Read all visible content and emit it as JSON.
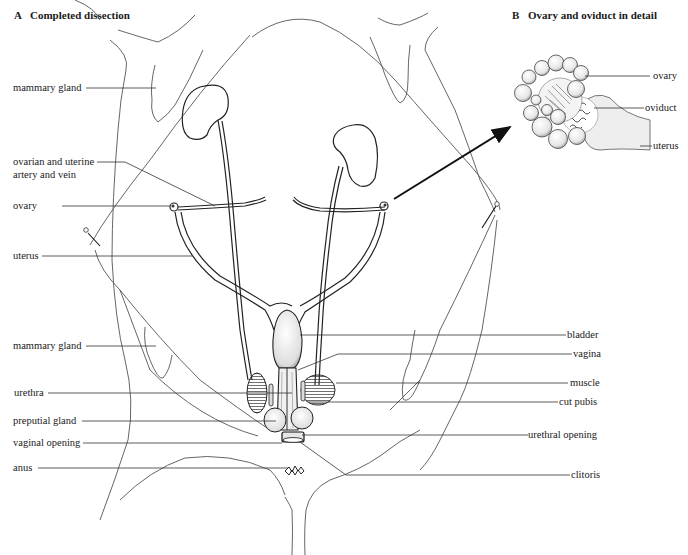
{
  "panel_a": {
    "letter": "A",
    "title": "Completed dissection",
    "labels_left": [
      "mammary gland",
      "ovarian and uterine",
      "artery and vein",
      "ovary",
      "uterus",
      "mammary gland",
      "urethra",
      "preputial gland",
      "vaginal opening",
      "anus"
    ],
    "labels_right": [
      "bladder",
      "vagina",
      "muscle",
      "cut pubis",
      "urethral opening",
      "clitoris"
    ]
  },
  "panel_b": {
    "letter": "B",
    "title": "Ovary and oviduct in detail",
    "labels": [
      "ovary",
      "oviduct",
      "uterus"
    ]
  }
}
